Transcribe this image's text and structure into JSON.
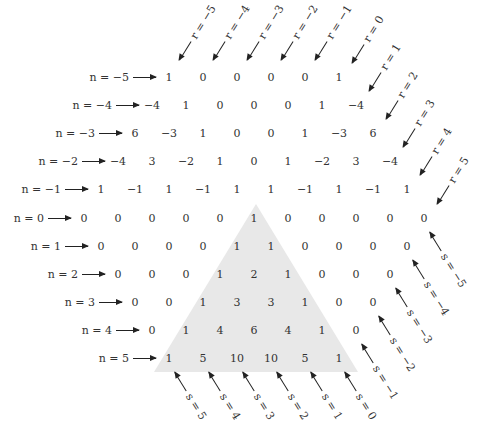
{
  "figure": {
    "shading_color": "#e8e8e8",
    "row_labels": [
      "n = −5",
      "n = −4",
      "n = −3",
      "n = −2",
      "n = −1",
      "n = 0",
      "n = 1",
      "n = 2",
      "n = 3",
      "n = 4",
      "n = 5"
    ],
    "rows": [
      {
        "n": -5,
        "label": "n = −5",
        "values": [
          "1",
          "0",
          "0",
          "0",
          "0",
          "1"
        ]
      },
      {
        "n": -4,
        "label": "n = −4",
        "values": [
          "−4",
          "1",
          "0",
          "0",
          "0",
          "1",
          "−4"
        ]
      },
      {
        "n": -3,
        "label": "n = −3",
        "values": [
          "6",
          "−3",
          "1",
          "0",
          "0",
          "1",
          "−3",
          "6"
        ]
      },
      {
        "n": -2,
        "label": "n = −2",
        "values": [
          "−4",
          "3",
          "−2",
          "1",
          "0",
          "1",
          "−2",
          "3",
          "−4"
        ]
      },
      {
        "n": -1,
        "label": "n = −1",
        "values": [
          "1",
          "−1",
          "1",
          "−1",
          "1",
          "1",
          "−1",
          "1",
          "−1",
          "1"
        ]
      },
      {
        "n": 0,
        "label": "n = 0",
        "values": [
          "0",
          "0",
          "0",
          "0",
          "0",
          "1",
          "0",
          "0",
          "0",
          "0",
          "0"
        ]
      },
      {
        "n": 1,
        "label": "n = 1",
        "values": [
          "0",
          "0",
          "0",
          "0",
          "1",
          "1",
          "0",
          "0",
          "0",
          "0"
        ]
      },
      {
        "n": 2,
        "label": "n = 2",
        "values": [
          "0",
          "0",
          "0",
          "1",
          "2",
          "1",
          "0",
          "0",
          "0"
        ]
      },
      {
        "n": 3,
        "label": "n = 3",
        "values": [
          "0",
          "0",
          "1",
          "3",
          "3",
          "1",
          "0",
          "0"
        ]
      },
      {
        "n": 4,
        "label": "n = 4",
        "values": [
          "0",
          "1",
          "4",
          "6",
          "4",
          "1",
          "0"
        ]
      },
      {
        "n": 5,
        "label": "n = 5",
        "values": [
          "1",
          "5",
          "10",
          "10",
          "5",
          "1"
        ]
      }
    ],
    "r_labels": [
      "r = −5",
      "r = −4",
      "r = −3",
      "r = −2",
      "r = −1",
      "r = 0",
      "r = 1",
      "r = 2",
      "r = 3",
      "r = 4",
      "r = 5"
    ],
    "s_labels": [
      "s = 5",
      "s = 4",
      "s = 3",
      "s = 2",
      "s = 1",
      "s = 0",
      "s = −1",
      "s = −2",
      "s = −3",
      "s = −4",
      "s = −5"
    ]
  }
}
